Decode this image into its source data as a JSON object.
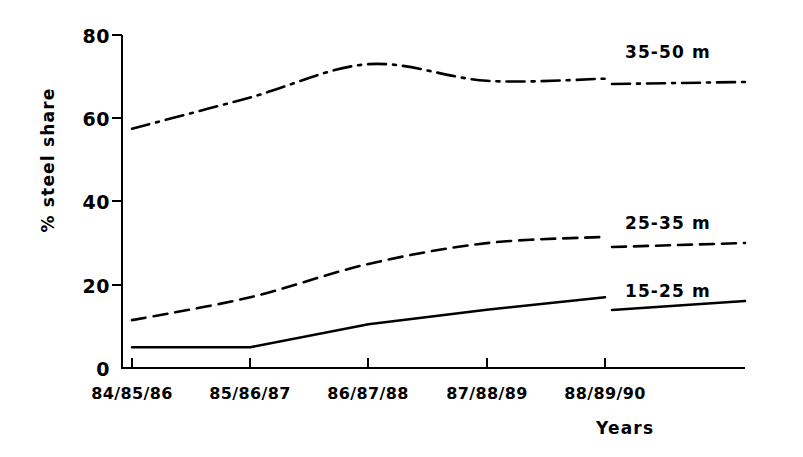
{
  "chart_data": {
    "type": "line",
    "title": "",
    "xlabel": "Years",
    "ylabel": "% steel share",
    "ylim": [
      0,
      80
    ],
    "yticks": [
      0,
      20,
      40,
      60,
      80
    ],
    "ytick_labels": [
      "0",
      "20",
      "40",
      "60",
      "80"
    ],
    "categories": [
      "84/85/86",
      "85/86/87",
      "86/87/88",
      "87/88/89",
      "88/89/90"
    ],
    "grid": false,
    "legend_position": "inline-right",
    "series": [
      {
        "name": "35-50 m",
        "style": "dash-dot",
        "values": [
          57.5,
          65.0,
          73.0,
          69.0,
          69.5
        ],
        "label": "35-50  m"
      },
      {
        "name": "25-35 m",
        "style": "dashed",
        "values": [
          11.5,
          17.0,
          25.0,
          30.0,
          31.5
        ],
        "label": "25-35  m"
      },
      {
        "name": "15-25 m",
        "style": "solid",
        "values": [
          5.0,
          5.0,
          10.5,
          14.0,
          17.0
        ],
        "label": "15-25  m"
      }
    ]
  },
  "axis": {
    "y_title": "% steel share",
    "x_title": "Years"
  },
  "colors": {
    "ink": "#000000",
    "background": "#ffffff"
  }
}
